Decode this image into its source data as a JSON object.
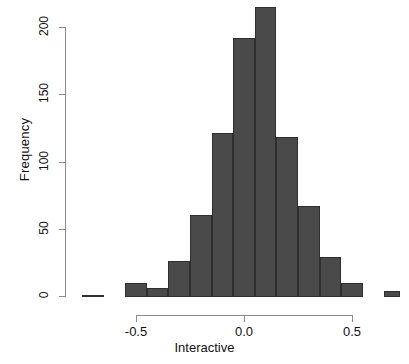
{
  "chart_data": {
    "type": "bar",
    "title": "",
    "subtitle": "",
    "xlabel": "Interactive",
    "ylabel": "Frequency",
    "grid": false,
    "legend": null,
    "xlim": [
      -0.78,
      0.72
    ],
    "ylim": [
      0,
      215
    ],
    "xticks": [
      -0.5,
      0.0,
      0.5
    ],
    "xtick_labels": [
      "-0.5",
      "0.0",
      "0.5"
    ],
    "yticks": [
      0,
      50,
      100,
      150,
      200
    ],
    "ytick_labels": [
      "0",
      "50",
      "100",
      "150",
      "200"
    ],
    "bin_width": 0.1,
    "bin_edges": [
      -0.75,
      -0.65,
      -0.55,
      -0.45,
      -0.35,
      -0.25,
      -0.15,
      -0.05,
      0.05,
      0.15,
      0.25,
      0.35,
      0.45,
      0.55,
      0.65,
      0.7
    ],
    "categories": [
      "-0.75",
      "-0.65",
      "-0.55",
      "-0.45",
      "-0.35",
      "-0.25",
      "-0.15",
      "-0.05",
      "0.05",
      "0.15",
      "0.25",
      "0.35",
      "0.45",
      "0.55",
      "0.65"
    ],
    "values": [
      1,
      0,
      10,
      6,
      26,
      60,
      121,
      192,
      215,
      118,
      67,
      29,
      10,
      0,
      4
    ],
    "bars": [
      {
        "x0": -0.75,
        "x1": -0.65,
        "value": 1
      },
      {
        "x0": -0.65,
        "x1": -0.55,
        "value": 0
      },
      {
        "x0": -0.55,
        "x1": -0.45,
        "value": 10
      },
      {
        "x0": -0.45,
        "x1": -0.35,
        "value": 6
      },
      {
        "x0": -0.35,
        "x1": -0.25,
        "value": 26
      },
      {
        "x0": -0.25,
        "x1": -0.15,
        "value": 60
      },
      {
        "x0": -0.15,
        "x1": -0.05,
        "value": 121
      },
      {
        "x0": -0.05,
        "x1": 0.05,
        "value": 192
      },
      {
        "x0": 0.05,
        "x1": 0.15,
        "value": 215
      },
      {
        "x0": 0.15,
        "x1": 0.25,
        "value": 118
      },
      {
        "x0": 0.25,
        "x1": 0.35,
        "value": 67
      },
      {
        "x0": 0.35,
        "x1": 0.45,
        "value": 29
      },
      {
        "x0": 0.45,
        "x1": 0.55,
        "value": 10
      },
      {
        "x0": 0.55,
        "x1": 0.65,
        "value": 0
      },
      {
        "x0": 0.65,
        "x1": 0.72,
        "value": 4
      }
    ],
    "colors": {
      "bar_fill": "#4a4a4a",
      "bar_stroke": "#2f2f2f",
      "axis": "#8a8a8a",
      "text": "#111111",
      "background": "#ffffff"
    }
  }
}
